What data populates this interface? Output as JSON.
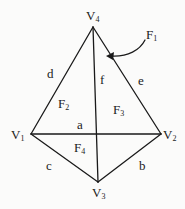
{
  "diagram": {
    "type": "planar graph (tetrahedron projection) with labeled vertices, edges and faces",
    "colors": {
      "line": "#1a1a1a",
      "background": "#fbfbfa"
    },
    "vertices": [
      {
        "id": "V1",
        "base": "V",
        "sub": "1",
        "x": 31,
        "y": 134
      },
      {
        "id": "V2",
        "base": "V",
        "sub": "2",
        "x": 161,
        "y": 134
      },
      {
        "id": "V3",
        "base": "V",
        "sub": "3",
        "x": 98,
        "y": 182
      },
      {
        "id": "V4",
        "base": "V",
        "sub": "4",
        "x": 93,
        "y": 27
      }
    ],
    "edges": [
      {
        "label": "a",
        "from": "V1",
        "to": "V2"
      },
      {
        "label": "b",
        "from": "V2",
        "to": "V3"
      },
      {
        "label": "c",
        "from": "V1",
        "to": "V3"
      },
      {
        "label": "d",
        "from": "V1",
        "to": "V4"
      },
      {
        "label": "e",
        "from": "V2",
        "to": "V4"
      },
      {
        "label": "f",
        "from": "V3",
        "to": "V4"
      }
    ],
    "faces": [
      {
        "id": "F1",
        "base": "F",
        "sub": "1",
        "note": "outer face, indicated by curved arrow"
      },
      {
        "id": "F2",
        "base": "F",
        "sub": "2"
      },
      {
        "id": "F3",
        "base": "F",
        "sub": "3"
      },
      {
        "id": "F4",
        "base": "F",
        "sub": "4"
      }
    ]
  }
}
